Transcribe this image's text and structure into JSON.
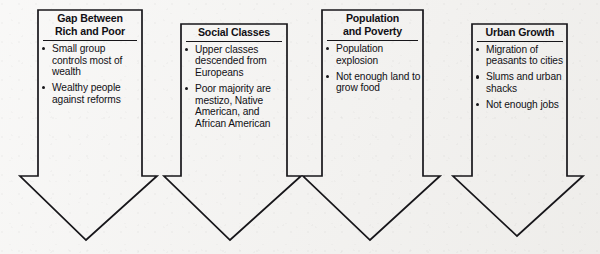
{
  "diagram": {
    "type": "four-arrow-flow",
    "background_color": "#f1f0ee",
    "line_color": "#17161a",
    "text_color": "#111015",
    "arrows": [
      {
        "title_lines": [
          "Gap Between",
          "Rich and Poor"
        ],
        "bullets": [
          "Small group controls most of wealth",
          "Wealthy people against reforms"
        ]
      },
      {
        "title_lines": [
          "Social Classes"
        ],
        "bullets": [
          "Upper classes descended from Europeans",
          "Poor majority are mestizo, Native American, and African American"
        ]
      },
      {
        "title_lines": [
          "Population",
          "and Poverty"
        ],
        "bullets": [
          "Population explosion",
          "Not enough land to grow food"
        ]
      },
      {
        "title_lines": [
          "Urban Growth"
        ],
        "bullets": [
          "Migration of peasants to cities",
          "Slums and urban shacks",
          "Not enough jobs"
        ]
      }
    ]
  }
}
